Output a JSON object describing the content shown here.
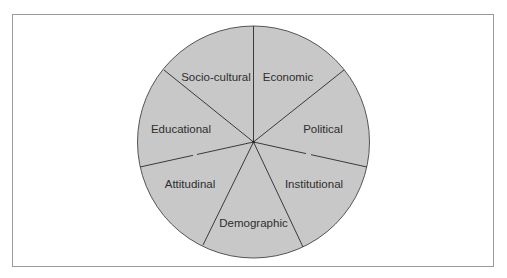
{
  "diagram": {
    "type": "pie-segmented-circle",
    "fill_color": "#c8c8c8",
    "line_color": "#444444",
    "frame_color": "#9a9a9a",
    "segments": [
      {
        "label": "Economic"
      },
      {
        "label": "Political"
      },
      {
        "label": "Institutional"
      },
      {
        "label": "Demographic"
      },
      {
        "label": "Attitudinal"
      },
      {
        "label": "Educational"
      },
      {
        "label": "Socio-cultural"
      }
    ]
  }
}
